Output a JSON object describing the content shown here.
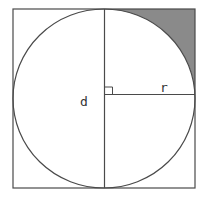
{
  "diagram": {
    "labels": {
      "diameter": "d",
      "radius": "r"
    },
    "colors": {
      "stroke": "#4a4a4a",
      "shaded_region": "#8a8a8a",
      "background": "#ffffff"
    },
    "elements": {
      "square": "outer square",
      "circle": "inscribed circle",
      "diameter_line": "vertical diameter",
      "radius_line": "horizontal radius",
      "right_angle_marker": "right angle",
      "shaded_corner": "shaded region between circle and top-right corner"
    }
  }
}
